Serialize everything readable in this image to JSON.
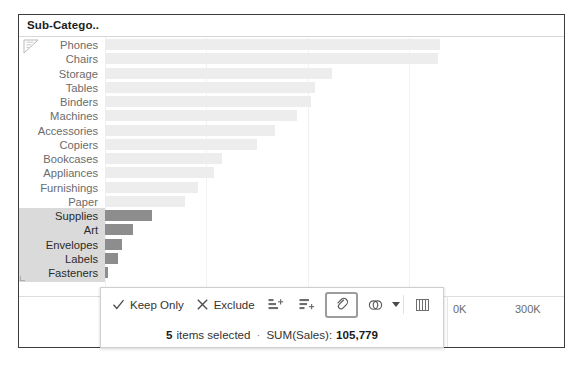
{
  "viz": {
    "field_header": "Sub-Catego..",
    "sort_icon": "sort-descending-glyph"
  },
  "chart_data": {
    "type": "bar",
    "orientation": "horizontal",
    "title": "",
    "xlabel": "",
    "ylabel": "Sub-Category",
    "categories": [
      "Phones",
      "Chairs",
      "Storage",
      "Tables",
      "Binders",
      "Machines",
      "Accessories",
      "Copiers",
      "Bookcases",
      "Appliances",
      "Furnishings",
      "Paper",
      "Supplies",
      "Art",
      "Envelopes",
      "Labels",
      "Fasteners"
    ],
    "values": [
      330007,
      328449,
      223844,
      206966,
      203413,
      189239,
      167380,
      149528,
      114880,
      107532,
      91705,
      78479,
      46674,
      27119,
      16476,
      12486,
      3024
    ],
    "value_unit": "SUM(Sales)",
    "selected_categories": [
      "Supplies",
      "Art",
      "Envelopes",
      "Labels",
      "Fasteners"
    ],
    "axis_ticks": [
      {
        "label": "0K",
        "value": 0
      },
      {
        "label": "300K",
        "value": 300000
      }
    ],
    "xlim": [
      0,
      340000
    ],
    "grid": true,
    "legend": "none",
    "colors": {
      "bar_unselected": "#ededed",
      "bar_selected": "#8d8d8d",
      "selection_band": "#d2d2d2",
      "frame_border": "#3c3c3c"
    }
  },
  "tooltip": {
    "keep_only_label": "Keep Only",
    "exclude_label": "Exclude",
    "icons": {
      "check": "check-icon",
      "close": "x-icon",
      "sort_asc": "sort-ascending-icon",
      "sort_desc": "sort-descending-icon",
      "group": "group-members-icon",
      "set": "create-set-icon",
      "view_data": "view-data-icon"
    },
    "active_button": "group-members-icon",
    "summary": {
      "count": "5",
      "count_text": "items selected",
      "separator": "·",
      "measure_label": "SUM(Sales):",
      "measure_value": "105,779"
    }
  }
}
